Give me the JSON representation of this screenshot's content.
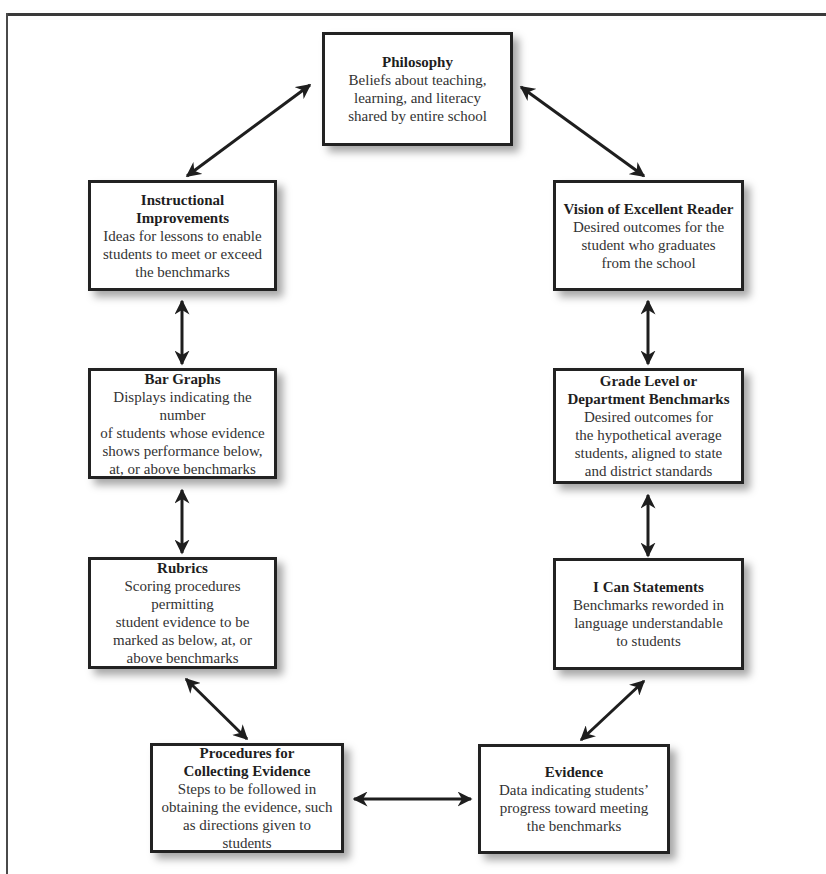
{
  "diagram": {
    "type": "cycle-flowchart",
    "nodes": [
      {
        "id": "philosophy",
        "title": "Philosophy",
        "desc_lines": [
          "Beliefs about teaching,",
          "learning, and literacy",
          "shared by entire school"
        ]
      },
      {
        "id": "vision",
        "title": "Vision of Excellent Reader",
        "desc_lines": [
          "Desired outcomes for the",
          "student who graduates",
          "from the school"
        ]
      },
      {
        "id": "benchmarks",
        "title_lines": [
          "Grade Level or",
          "Department Benchmarks"
        ],
        "desc_lines": [
          "Desired outcomes for",
          "the hypothetical average",
          "students, aligned to state",
          "and district standards"
        ]
      },
      {
        "id": "i-can",
        "title": "I Can Statements",
        "desc_lines": [
          "Benchmarks reworded in",
          "language understandable",
          "to students"
        ]
      },
      {
        "id": "evidence",
        "title": "Evidence",
        "desc_lines": [
          "Data indicating students’",
          "progress toward meeting",
          "the benchmarks"
        ]
      },
      {
        "id": "procedures",
        "title_lines": [
          "Procedures for",
          "Collecting Evidence"
        ],
        "desc_lines": [
          "Steps to be followed in",
          "obtaining the evidence, such",
          "as directions given to students"
        ]
      },
      {
        "id": "rubrics",
        "title": "Rubrics",
        "desc_lines": [
          "Scoring procedures permitting",
          "student evidence  to be",
          "marked as below, at, or",
          "above benchmarks"
        ]
      },
      {
        "id": "bar-graphs",
        "title": "Bar Graphs",
        "desc_lines": [
          "Displays indicating the number",
          "of students whose evidence",
          "shows performance below,",
          "at, or above benchmarks"
        ]
      },
      {
        "id": "instructional",
        "title": "Instructional Improvements",
        "desc_lines": [
          "Ideas for lessons to enable",
          "students to meet or exceed",
          "the benchmarks"
        ]
      }
    ],
    "edges": [
      {
        "from": "philosophy",
        "to": "vision",
        "bidirectional": true
      },
      {
        "from": "vision",
        "to": "benchmarks",
        "bidirectional": true
      },
      {
        "from": "benchmarks",
        "to": "i-can",
        "bidirectional": true
      },
      {
        "from": "i-can",
        "to": "evidence",
        "bidirectional": true
      },
      {
        "from": "evidence",
        "to": "procedures",
        "bidirectional": true
      },
      {
        "from": "procedures",
        "to": "rubrics",
        "bidirectional": true
      },
      {
        "from": "rubrics",
        "to": "bar-graphs",
        "bidirectional": true
      },
      {
        "from": "bar-graphs",
        "to": "instructional",
        "bidirectional": true
      },
      {
        "from": "instructional",
        "to": "philosophy",
        "bidirectional": true
      }
    ],
    "colors": {
      "border": "#222222",
      "arrow": "#1e1e1e",
      "background": "#ffffff"
    }
  },
  "n": {
    "philosophy": {
      "title": "Philosophy",
      "d1": "Beliefs about teaching,",
      "d2": "learning, and literacy",
      "d3": "shared by entire school"
    },
    "vision": {
      "title": "Vision of Excellent Reader",
      "d1": "Desired outcomes for the",
      "d2": "student who graduates",
      "d3": "from the school"
    },
    "benchmarks": {
      "t1": "Grade Level or",
      "t2": "Department Benchmarks",
      "d1": "Desired outcomes for",
      "d2": "the hypothetical average",
      "d3": "students, aligned to state",
      "d4": "and district standards"
    },
    "ican": {
      "title": "I Can Statements",
      "d1": "Benchmarks reworded in",
      "d2": "language understandable",
      "d3": "to students"
    },
    "evidence": {
      "title": "Evidence",
      "d1": "Data indicating students’",
      "d2": "progress toward meeting",
      "d3": "the benchmarks"
    },
    "procedures": {
      "t1": "Procedures for",
      "t2": "Collecting Evidence",
      "d1": "Steps to be followed in",
      "d2": "obtaining the evidence, such",
      "d3": "as directions given to students"
    },
    "rubrics": {
      "title": "Rubrics",
      "d1": "Scoring procedures permitting",
      "d2": "student evidence  to be",
      "d3": "marked as below, at, or",
      "d4": "above benchmarks"
    },
    "bargraphs": {
      "title": "Bar Graphs",
      "d1": "Displays indicating the number",
      "d2": "of students whose evidence",
      "d3": "shows performance below,",
      "d4": "at, or above benchmarks"
    },
    "instructional": {
      "title": "Instructional Improvements",
      "d1": "Ideas for lessons to enable",
      "d2": "students to meet or exceed",
      "d3": "the benchmarks"
    }
  }
}
